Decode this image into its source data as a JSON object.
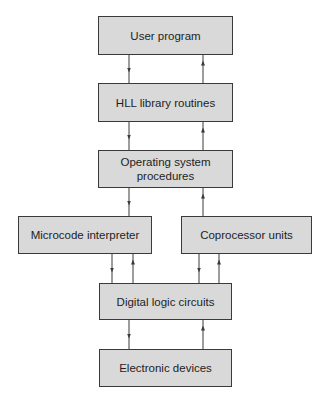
{
  "diagram": {
    "title": "",
    "nodes": [
      {
        "id": "user",
        "label": "User program"
      },
      {
        "id": "hll",
        "label": "HLL library routines"
      },
      {
        "id": "os",
        "label": "Operating system procedures",
        "lines": [
          "Operating system",
          "procedures"
        ]
      },
      {
        "id": "micro",
        "label": "Microcode interpreter"
      },
      {
        "id": "copro",
        "label": "Coprocessor units"
      },
      {
        "id": "digital",
        "label": "Digital logic circuits"
      },
      {
        "id": "electronic",
        "label": "Electronic devices"
      }
    ],
    "edges": [
      {
        "from": "user",
        "to": "hll"
      },
      {
        "from": "hll",
        "to": "user"
      },
      {
        "from": "hll",
        "to": "os"
      },
      {
        "from": "os",
        "to": "hll"
      },
      {
        "from": "os",
        "to": "micro"
      },
      {
        "from": "copro",
        "to": "os"
      },
      {
        "from": "micro",
        "to": "digital"
      },
      {
        "from": "digital",
        "to": "micro"
      },
      {
        "from": "copro",
        "to": "digital"
      },
      {
        "from": "digital",
        "to": "copro"
      },
      {
        "from": "digital",
        "to": "electronic"
      },
      {
        "from": "electronic",
        "to": "digital"
      }
    ],
    "colors": {
      "box_fill": "#d9d9d9",
      "box_border": "#3a3a3a",
      "arrow": "#3a3a3a"
    }
  }
}
